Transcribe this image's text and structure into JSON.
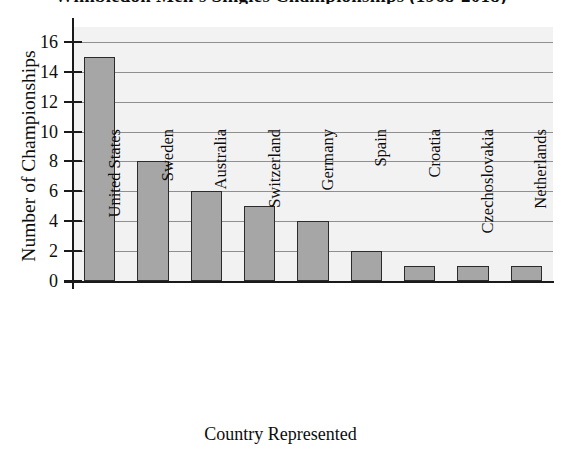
{
  "chart_data": {
    "type": "bar",
    "title": "Wimbledon Men's Singles Championships (1968-2018)",
    "xlabel": "Country Represented",
    "ylabel": "Number of Championships",
    "categories": [
      "United States",
      "Sweden",
      "Australia",
      "Switzerland",
      "Germany",
      "Spain",
      "Croatia",
      "Czechoslovakia",
      "Netherlands"
    ],
    "values": [
      15,
      8,
      6,
      5,
      4,
      2,
      1,
      1,
      1
    ],
    "ylim": [
      0,
      17
    ],
    "yticks": [
      0,
      2,
      4,
      6,
      8,
      10,
      12,
      14,
      16
    ],
    "ytick_labels": [
      "0",
      "2",
      "4",
      "6",
      "8",
      "10",
      "12",
      "14",
      "16"
    ],
    "grid": true,
    "legend": null,
    "legend_position": "none",
    "colors": {
      "bar_fill": "#a6a6a6",
      "bar_edge": "#2b2b2b",
      "plot_background": "#f2f2f2",
      "gridline": "#8f8f8f",
      "axis": "#1a1a1a",
      "text": "#0d0d0d"
    }
  }
}
